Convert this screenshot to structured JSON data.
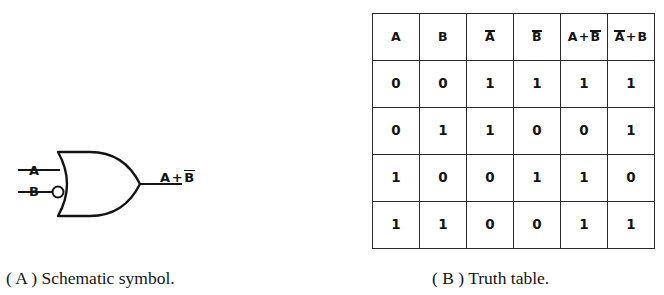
{
  "figure_a": {
    "caption": "( A ) Schematic symbol.",
    "gate_type": "or-gate-with-inverted-b-input",
    "inputs": [
      {
        "label": "A",
        "inverted": false
      },
      {
        "label": "B",
        "inverted": true
      }
    ],
    "output": {
      "expression_parts": [
        "A",
        "+",
        "B"
      ],
      "output_text_plain": "A + B̄",
      "term1": "A",
      "operator": "+",
      "term2": "B",
      "term2_overbar": true
    }
  },
  "figure_b": {
    "caption": "( B ) Truth table.",
    "headers": [
      {
        "text": "A",
        "overbar_first": false,
        "type": "plain"
      },
      {
        "text": "B",
        "overbar_first": false,
        "type": "plain"
      },
      {
        "text": "A",
        "overbar_first": true,
        "type": "bar"
      },
      {
        "text": "B",
        "overbar_first": true,
        "type": "bar"
      },
      {
        "left": "A",
        "op": "+",
        "right": "B",
        "right_bar": true,
        "left_bar": false,
        "type": "expr",
        "text": "A+B̄"
      },
      {
        "left": "A",
        "op": "+",
        "right": "B",
        "right_bar": false,
        "left_bar": true,
        "type": "expr",
        "text": "Ā+B"
      }
    ],
    "rows": [
      [
        "0",
        "0",
        "1",
        "1",
        "1",
        "1"
      ],
      [
        "0",
        "1",
        "1",
        "0",
        "0",
        "1"
      ],
      [
        "1",
        "0",
        "0",
        "1",
        "1",
        "0"
      ],
      [
        "1",
        "1",
        "0",
        "0",
        "1",
        "1"
      ]
    ]
  },
  "colors": {
    "background": "#ffffff",
    "ink": "#141414",
    "rule": "#2a2a2a"
  }
}
